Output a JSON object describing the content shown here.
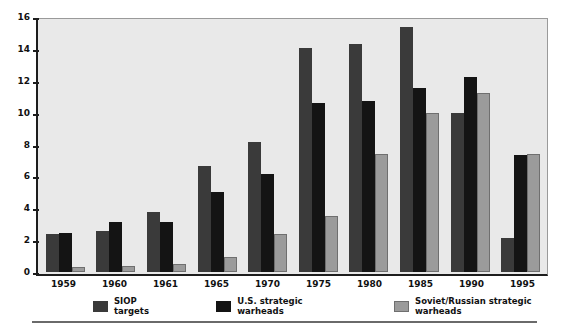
{
  "chart_data": {
    "type": "bar",
    "title": "",
    "subtitle": "",
    "xlabel": "",
    "ylabel": "",
    "categories": [
      "1959",
      "1960",
      "1961",
      "1965",
      "1970",
      "1975",
      "1980",
      "1985",
      "1990",
      "1995"
    ],
    "series": [
      {
        "name": "SIOP targets",
        "color": "#3a3a3a",
        "values": [
          2.4,
          2.6,
          3.8,
          6.7,
          8.25,
          14.25,
          14.45,
          15.55,
          10.1,
          2.15
        ]
      },
      {
        "name": "U.S. strategic warheads",
        "color": "#141414",
        "values": [
          2.5,
          3.15,
          3.2,
          5.1,
          6.2,
          10.75,
          10.85,
          11.7,
          12.4,
          7.4
        ]
      },
      {
        "name": "Soviet/Russian strategic warheads",
        "color": "#9b9b9b",
        "values": [
          0.35,
          0.4,
          0.5,
          0.95,
          2.4,
          3.55,
          7.5,
          10.1,
          11.35,
          7.5
        ]
      }
    ],
    "ylim": [
      0,
      16
    ],
    "yticks": [
      "0",
      "2",
      "4",
      "6",
      "8",
      "10",
      "12",
      "14",
      "16"
    ],
    "ytick_values": [
      0,
      2,
      4,
      6,
      8,
      10,
      12,
      14,
      16
    ],
    "grid": false,
    "legend_position": "bottom",
    "plot_background": "#e9e9e9",
    "axis_color": "#1d1d1d"
  }
}
